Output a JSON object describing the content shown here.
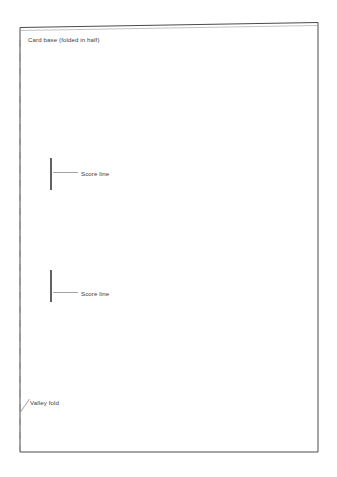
{
  "diagram": {
    "background_color": "#ffffff",
    "canvas": {
      "width": 337,
      "height": 477
    },
    "card": {
      "name": "card-base-outline",
      "stroke_color": "#4a4a4a",
      "stroke_width": 1,
      "corners": {
        "top_left": {
          "x": 20,
          "y": 27.5
        },
        "top_right": {
          "x": 318,
          "y": 22.5
        },
        "bottom_right": {
          "x": 318,
          "y": 452
        },
        "bottom_left": {
          "x": 20,
          "y": 452
        }
      }
    },
    "valley_fold_line": {
      "name": "valley-fold-dashed-line",
      "stroke_color": "#8a8a8a",
      "stroke_width": 1,
      "dash_pattern": "7 7",
      "x": 20,
      "y_start": 40,
      "y_end": 452
    },
    "score_lines": [
      {
        "name": "score-line-upper",
        "x": 51,
        "y_start": 158,
        "y_end": 190,
        "stroke_color": "#2e2e2e",
        "stroke_width": 1.5,
        "leader": {
          "x_start": 53,
          "x_end": 78,
          "y": 172.5
        }
      },
      {
        "name": "score-line-lower",
        "x": 51,
        "y_start": 270,
        "y_end": 302,
        "stroke_color": "#2e2e2e",
        "stroke_width": 1.5,
        "leader": {
          "x_start": 53,
          "x_end": 78,
          "y": 292.5
        }
      }
    ],
    "valley_fold_leader": {
      "name": "valley-fold-leader",
      "x_start": 29.5,
      "y_start": 399,
      "x_end": 20.5,
      "y_end": 412,
      "stroke_color": "#8a8a8a",
      "stroke_width": 0.8
    },
    "labels": {
      "card_base": "Card base (folded in half)",
      "score_line_top": "Score line",
      "score_line_bottom": "Score line",
      "valley_fold": "Valley fold"
    },
    "colors": {
      "card_stroke": "#4a4a4a",
      "fold_stroke": "#8a8a8a",
      "score_stroke": "#2e2e2e",
      "text": "#3b3b3b",
      "background": "#ffffff"
    }
  }
}
